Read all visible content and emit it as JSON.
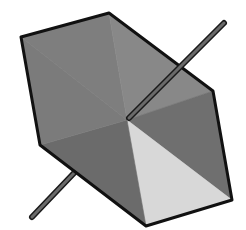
{
  "diagram": {
    "type": "hexagonal-prism-with-axis",
    "background": "#ffffff",
    "outline_color": "#111111",
    "center": [
      127,
      120
    ],
    "vertices": [
      [
        21,
        37
      ],
      [
        109,
        13
      ],
      [
        213,
        91
      ],
      [
        232,
        200
      ],
      [
        146,
        226
      ],
      [
        40,
        145
      ]
    ],
    "faces": [
      {
        "name": "face-top-left",
        "points": [
          [
            127,
            120
          ],
          [
            21,
            37
          ],
          [
            109,
            13
          ]
        ],
        "fill": "#7e7e7e"
      },
      {
        "name": "face-top-right",
        "points": [
          [
            127,
            120
          ],
          [
            109,
            13
          ],
          [
            213,
            91
          ]
        ],
        "fill": "#888888"
      },
      {
        "name": "face-right",
        "points": [
          [
            127,
            120
          ],
          [
            213,
            91
          ],
          [
            232,
            200
          ]
        ],
        "fill": "#6f6f6f"
      },
      {
        "name": "face-bottom-right-lit",
        "points": [
          [
            127,
            120
          ],
          [
            232,
            200
          ],
          [
            146,
            226
          ]
        ],
        "fill": "#d8d8d8"
      },
      {
        "name": "face-bottom-left",
        "points": [
          [
            127,
            120
          ],
          [
            146,
            226
          ],
          [
            40,
            145
          ]
        ],
        "fill": "#6b6b6b"
      },
      {
        "name": "face-left",
        "points": [
          [
            127,
            120
          ],
          [
            40,
            145
          ],
          [
            21,
            37
          ]
        ],
        "fill": "#7b7b7b"
      }
    ],
    "rod": {
      "color": "#6a6a6a",
      "outline": "#1a1a1a",
      "back_segment": [
        [
          32,
          217
        ],
        [
          75,
          172
        ]
      ],
      "front_segment": [
        [
          129,
          118
        ],
        [
          224,
          23
        ]
      ]
    }
  }
}
